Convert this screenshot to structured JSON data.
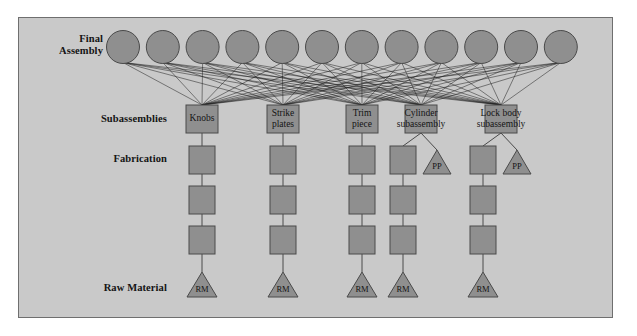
{
  "figure": {
    "background_color": "#c9c9c9",
    "page_color": "#ffffff",
    "border_color": "#6f6f6f",
    "node_fill": "#8f8f8f",
    "node_stroke": "#4a4a4a",
    "edge_color": "#1c1c1c"
  },
  "stage_labels": [
    {
      "id": "final-assembly",
      "text": "Final\nAssembly",
      "x": 103,
      "y": 33
    },
    {
      "id": "subassemblies",
      "text": "Subassemblies",
      "x": 167,
      "y": 113
    },
    {
      "id": "fabrication",
      "text": "Fabrication",
      "x": 167,
      "y": 153
    },
    {
      "id": "raw-material",
      "text": "Raw Material",
      "x": 167,
      "y": 282
    }
  ],
  "final_assembly": {
    "label": "Final Assembly",
    "count": 12,
    "radius": 16.5,
    "cy": 47,
    "first_cx": 123,
    "spacing": 39.8
  },
  "subassemblies": {
    "label": "Subassemblies",
    "box_width": 32,
    "box_height": 28,
    "cy": 119,
    "items": [
      {
        "id": "knobs",
        "label": "Knobs",
        "label_lines": [
          "Knobs"
        ],
        "cx": 202,
        "label_overflow": false
      },
      {
        "id": "strike-plates",
        "label": "Strike plates",
        "label_lines": [
          "Strike",
          "plates"
        ],
        "cx": 283,
        "label_overflow": false
      },
      {
        "id": "trim-piece",
        "label": "Trim piece",
        "label_lines": [
          "Trim",
          "piece"
        ],
        "cx": 362,
        "label_overflow": false
      },
      {
        "id": "cylinder-subassembly",
        "label": "Cylinder subassembly",
        "label_lines": [
          "Cylinder",
          "subassembly"
        ],
        "cx": 421,
        "label_overflow": true
      },
      {
        "id": "lock-body-subassembly",
        "label": "Lock body subassembly",
        "label_lines": [
          "Lock body",
          "subassembly"
        ],
        "cx": 501,
        "label_overflow": true
      }
    ]
  },
  "fabrication": {
    "label": "Fabrication",
    "box_width": 26,
    "box_height": 28,
    "row_centers": [
      160,
      200,
      240
    ],
    "columns": [
      {
        "id": "knobs-chain",
        "parent": "knobs",
        "cx": 202,
        "rows": 3
      },
      {
        "id": "strike-plates-chain",
        "parent": "strike-plates",
        "cx": 283,
        "rows": 3
      },
      {
        "id": "trim-piece-chain",
        "parent": "trim-piece",
        "cx": 362,
        "rows": 3
      },
      {
        "id": "cylinder-left-chain",
        "parent": "cylinder-subassembly",
        "cx": 403,
        "rows": 3
      },
      {
        "id": "lock-body-left-chain",
        "parent": "lock-body-subassembly",
        "cx": 483,
        "rows": 3
      }
    ]
  },
  "purchased_parts": {
    "glyph": "PP",
    "label": "Purchased Part",
    "half_width": 14,
    "height": 24,
    "base_y": 174,
    "items": [
      {
        "id": "pp-cylinder",
        "parent": "cylinder-subassembly",
        "cx": 437,
        "text": "PP"
      },
      {
        "id": "pp-lock-body",
        "parent": "lock-body-subassembly",
        "cx": 517,
        "text": "PP"
      }
    ]
  },
  "raw_materials": {
    "label": "Raw Material",
    "glyph": "RM",
    "half_width": 15,
    "height": 25,
    "base_y": 297,
    "items": [
      {
        "id": "rm-knobs",
        "parent": "knobs-chain",
        "cx": 202,
        "text": "RM"
      },
      {
        "id": "rm-strike-plates",
        "parent": "strike-plates-chain",
        "cx": 283,
        "text": "RM"
      },
      {
        "id": "rm-trim-piece",
        "parent": "trim-piece-chain",
        "cx": 362,
        "text": "RM"
      },
      {
        "id": "rm-cylinder",
        "parent": "cylinder-left-chain",
        "cx": 403,
        "text": "RM"
      },
      {
        "id": "rm-lock-body",
        "parent": "lock-body-left-chain",
        "cx": 483,
        "text": "RM"
      }
    ]
  },
  "connections": {
    "type": "complete-bipartite",
    "from": "final_assembly",
    "to": "subassemblies",
    "description": "Every final assembly circle connects to every subassembly box"
  }
}
